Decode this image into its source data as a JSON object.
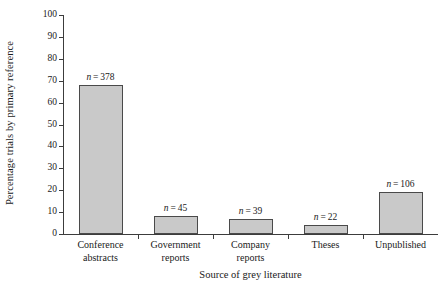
{
  "chart_data": {
    "type": "bar",
    "title": "",
    "xlabel": "Source of grey literature",
    "ylabel": "Percentage trials by primary reference",
    "categories": [
      "Conference abstracts",
      "Government reports",
      "Company reports",
      "Theses",
      "Unpublished"
    ],
    "category_lines": [
      [
        "Conference",
        "abstracts"
      ],
      [
        "Government",
        "reports"
      ],
      [
        "Company",
        "reports"
      ],
      [
        "Theses"
      ],
      [
        "Unpublished"
      ]
    ],
    "values": [
      68,
      8,
      7,
      4,
      19
    ],
    "annotations": [
      "n = 378",
      "n = 45",
      "n = 39",
      "n = 22",
      "n = 106"
    ],
    "annotation_counts": [
      378,
      45,
      39,
      22,
      106
    ],
    "ylim": [
      0,
      100
    ],
    "ytick_step": 10,
    "yticks": [
      0,
      10,
      20,
      30,
      40,
      50,
      60,
      70,
      80,
      90,
      100
    ],
    "ytick_labels": [
      "0",
      "10",
      "20",
      "30",
      "40",
      "50",
      "60",
      "70",
      "80",
      "90",
      "100"
    ],
    "grid": false,
    "legend": false,
    "bar_fill_color": "#c9c9c9",
    "bar_edge_color": "#4a4a4a",
    "axis_color": "#3c3c3c"
  }
}
